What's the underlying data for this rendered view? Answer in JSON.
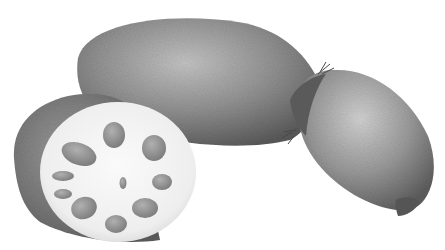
{
  "image": {
    "subject": "Lotus root illustration",
    "description": "Grayscale watercolor-style illustration of lotus roots: a cut cross-section slice on the left showing holes, a long oblong segment in the center, and a rounded segment on the right with fibrous joint.",
    "width": 445,
    "height": 250,
    "colors": {
      "background": "#ffffff",
      "skin_dark": "#5f5f5f",
      "skin_mid": "#8a8a8a",
      "skin_light": "#bdbdbd",
      "flesh": "#f2f2f2",
      "holes": "#8e8e8e"
    }
  }
}
